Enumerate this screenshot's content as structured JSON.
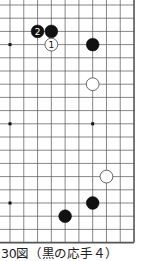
{
  "caption": "30図（黒の応手４）",
  "board": {
    "columns": 10,
    "rows": 19,
    "x0": 10,
    "dx": 13.78,
    "y0": 5,
    "dy": 13.2,
    "right_edge": true,
    "bottom_edge": true,
    "left_open": true,
    "top_open": true,
    "line_color": "#555555",
    "star_points": [
      [
        0,
        3
      ],
      [
        0,
        9
      ],
      [
        6,
        9
      ],
      [
        0,
        15
      ]
    ],
    "stones": [
      {
        "col": 2,
        "row": 2,
        "color": "black",
        "label": "2"
      },
      {
        "col": 3,
        "row": 2,
        "color": "black",
        "label": ""
      },
      {
        "col": 3,
        "row": 3,
        "color": "white",
        "label": "1"
      },
      {
        "col": 6,
        "row": 3,
        "color": "black",
        "label": ""
      },
      {
        "col": 6,
        "row": 6,
        "color": "white",
        "label": ""
      },
      {
        "col": 7,
        "row": 13,
        "color": "white",
        "label": ""
      },
      {
        "col": 6,
        "row": 15,
        "color": "black",
        "label": ""
      },
      {
        "col": 4,
        "row": 16,
        "color": "black",
        "label": ""
      }
    ]
  }
}
